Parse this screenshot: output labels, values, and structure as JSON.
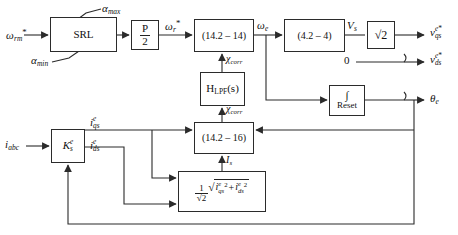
{
  "diagram": {
    "stroke_color": "#2b2b2b",
    "background": "#ffffff"
  },
  "blocks": {
    "srl": {
      "label": "SRL",
      "x": 50,
      "y": 17,
      "w": 67,
      "h": 35
    },
    "pole_pairs": {
      "numerator": "P",
      "denominator": "2",
      "x": 131,
      "y": 20,
      "w": 28,
      "h": 30
    },
    "eq_14_2_14": {
      "label": "(14.2 – 14)",
      "x": 194,
      "y": 19,
      "w": 60,
      "h": 33
    },
    "eq_4_2_4": {
      "label": "(4.2 – 4)",
      "x": 284,
      "y": 19,
      "w": 61,
      "h": 33
    },
    "sqrt2_gain": {
      "label": "√2",
      "x": 367,
      "y": 21,
      "w": 28,
      "h": 28
    },
    "lpf": {
      "label": "H",
      "sub": "LPF",
      "arg": "(s)",
      "x": 200,
      "y": 72,
      "w": 45,
      "h": 34
    },
    "integrator_reset": {
      "symbol": "∫",
      "label": "Reset",
      "x": 329,
      "y": 85,
      "w": 36,
      "h": 31
    },
    "eq_14_2_16": {
      "label": "(14.2 – 16)",
      "x": 194,
      "y": 122,
      "w": 60,
      "h": 32
    },
    "park_transform": {
      "label": "K",
      "sub": "s",
      "sup": "e",
      "x": 51,
      "y": 129,
      "w": 34,
      "h": 34
    },
    "rms_magnitude": {
      "coef_num": "1",
      "coef_den": "√2",
      "expr_a": "i",
      "expr_a_sup": "e",
      "expr_a_sub": "qs",
      "plus": "+",
      "expr_b": "i",
      "expr_b_sup": "e",
      "expr_b_sub": "ds",
      "power": "2",
      "x": 178,
      "y": 171,
      "w": 88,
      "h": 41
    }
  },
  "labels": {
    "input_speed_ref": {
      "base": "ω",
      "sub": "rm",
      "star": "*",
      "x": 6,
      "y": 30
    },
    "alpha_max": {
      "base": "α",
      "sub": "max",
      "x": 103,
      "y": 5
    },
    "alpha_min": {
      "base": "α",
      "sub": "min",
      "x": 33,
      "y": 57
    },
    "omega_r_ref": {
      "base": "ω",
      "sub": "r",
      "star": "*",
      "x": 166,
      "y": 21
    },
    "omega_e": {
      "base": "ω",
      "sub": "e",
      "x": 258,
      "y": 21
    },
    "v_s": {
      "base": "V",
      "sub": "s",
      "x": 348,
      "y": 21
    },
    "chi_corr_upper": {
      "base": "χ",
      "sub": "corr",
      "x": 217,
      "y": 56
    },
    "chi_corr_lower": {
      "base": "χ",
      "sub": "corr",
      "x": 217,
      "y": 106
    },
    "zero_input": {
      "text": "0",
      "x": 344,
      "y": 57
    },
    "out_vqs": {
      "base": "v",
      "sup": "e*",
      "sub": "qs",
      "x": 428,
      "y": 27
    },
    "out_vds": {
      "base": "v",
      "sup": "e*",
      "sub": "ds",
      "x": 428,
      "y": 57
    },
    "out_theta": {
      "base": "θ",
      "sub": "e",
      "x": 428,
      "y": 92
    },
    "i_abc": {
      "base": "i",
      "sub": "abc",
      "x": 6,
      "y": 138
    },
    "i_qs": {
      "base": "i",
      "sup": "e",
      "sub": "qs",
      "x": 90,
      "y": 117
    },
    "i_ds": {
      "base": "i",
      "sup": "e",
      "sub": "ds",
      "x": 90,
      "y": 140
    },
    "i_s": {
      "base": "I",
      "sub": "s",
      "x": 222,
      "y": 157
    }
  },
  "signals": {
    "names": [
      "speed-reference-input",
      "slew-rate-limiter-output",
      "electrical-speed-reference",
      "stator-frequency",
      "stator-voltage-magnitude",
      "correction-signal",
      "rotor-angle",
      "q-axis-current",
      "d-axis-current",
      "current-magnitude"
    ]
  }
}
